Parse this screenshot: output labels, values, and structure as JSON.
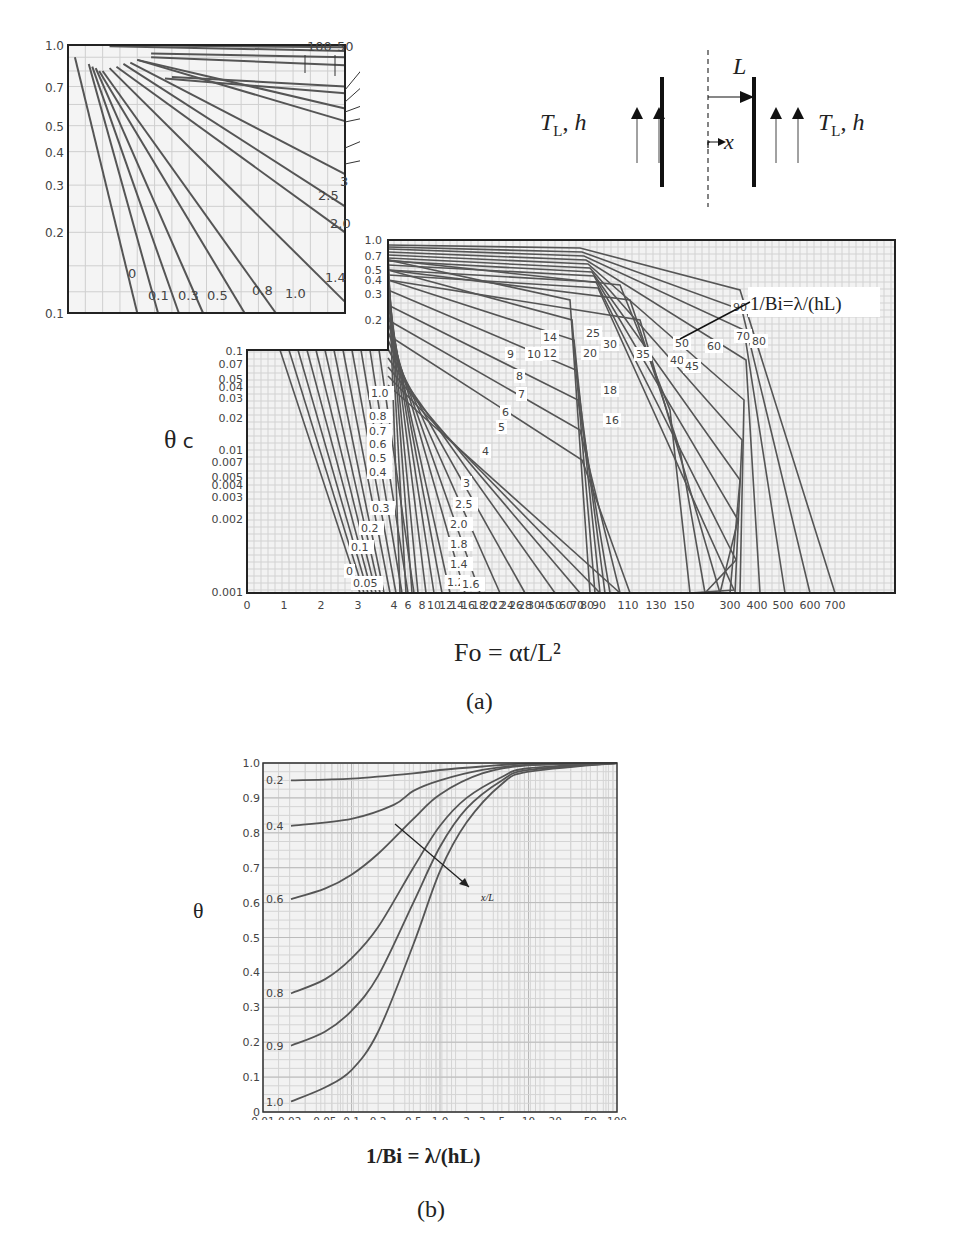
{
  "figure": {
    "caption_a": "(a)",
    "caption_b": "(b)"
  },
  "schematic": {
    "left_label_T": "T",
    "left_label_sub": "L",
    "left_label_rest": ", h",
    "right_label_T": "T",
    "right_label_sub": "L",
    "right_label_rest": ", h",
    "half_thickness_label": "L",
    "coordinate_label": "x"
  },
  "chart_data": [
    {
      "id": "a_inset",
      "type": "line",
      "title": "",
      "xlabel": "",
      "ylabel": "",
      "x_ticks": [
        "0",
        "1",
        "2",
        "3",
        "4"
      ],
      "y_ticks": [
        "1.0",
        "0.7",
        "0.5",
        "0.4",
        "0.3",
        "0.2",
        "0.1"
      ],
      "xlim": [
        0,
        4
      ],
      "ylim": [
        0.1,
        1.0
      ],
      "yscale": "log",
      "grid": true,
      "series_labels": [
        "0",
        "0.1",
        "0.3",
        "0.5",
        "0.8",
        "1.0",
        "1.4",
        "2.0",
        "2.5",
        "3",
        "6",
        "7",
        "9",
        "10",
        "20",
        "30",
        "50",
        "100"
      ],
      "series": [
        {
          "name": "0",
          "x": [
            0.1,
            1.0
          ],
          "y": [
            0.9,
            0.1
          ]
        },
        {
          "name": "0.1",
          "x": [
            0.3,
            1.3
          ],
          "y": [
            0.85,
            0.1
          ]
        },
        {
          "name": "0.3",
          "x": [
            0.35,
            1.6
          ],
          "y": [
            0.83,
            0.1
          ]
        },
        {
          "name": "0.5",
          "x": [
            0.4,
            1.95
          ],
          "y": [
            0.82,
            0.1
          ]
        },
        {
          "name": "0.8",
          "x": [
            0.45,
            2.55
          ],
          "y": [
            0.8,
            0.1
          ]
        },
        {
          "name": "1.0",
          "x": [
            0.5,
            3.0
          ],
          "y": [
            0.8,
            0.1
          ]
        },
        {
          "name": "1.4",
          "x": [
            0.6,
            4.0
          ],
          "y": [
            0.82,
            0.11
          ]
        },
        {
          "name": "2.0",
          "x": [
            0.7,
            4.0
          ],
          "y": [
            0.83,
            0.2
          ]
        },
        {
          "name": "2.5",
          "x": [
            0.8,
            4.0
          ],
          "y": [
            0.85,
            0.25
          ]
        },
        {
          "name": "3",
          "x": [
            0.9,
            4.0
          ],
          "y": [
            0.86,
            0.33
          ]
        },
        {
          "name": "6",
          "x": [
            1.0,
            4.0
          ],
          "y": [
            0.88,
            0.52
          ]
        },
        {
          "name": "7",
          "x": [
            1.0,
            4.0
          ],
          "y": [
            0.88,
            0.58
          ]
        },
        {
          "name": "9",
          "x": [
            1.4,
            4.0
          ],
          "y": [
            0.75,
            0.66
          ]
        },
        {
          "name": "10",
          "x": [
            1.5,
            4.0
          ],
          "y": [
            0.76,
            0.7
          ]
        },
        {
          "name": "20",
          "x": [
            1.2,
            4.0
          ],
          "y": [
            0.9,
            0.84
          ]
        },
        {
          "name": "30",
          "x": [
            1.2,
            4.0
          ],
          "y": [
            0.93,
            0.9
          ]
        },
        {
          "name": "50",
          "x": [
            0.6,
            4.0
          ],
          "y": [
            0.99,
            0.95
          ]
        },
        {
          "name": "100",
          "x": [
            0.6,
            4.0
          ],
          "y": [
            1.0,
            0.98
          ]
        }
      ]
    },
    {
      "id": "a_main",
      "type": "line",
      "title": "",
      "xlabel": "Fo = αt/L²",
      "ylabel": "θc",
      "legend_annotation": "1/Bi=λ/(hL)",
      "x_ticks": [
        "0",
        "1",
        "2",
        "3",
        "4",
        "6",
        "8",
        "10",
        "12",
        "14",
        "16",
        "18",
        "20",
        "22",
        "24",
        "26",
        "28",
        "30",
        "40",
        "50",
        "60",
        "70",
        "80",
        "90",
        "110",
        "130",
        "150",
        "300",
        "400",
        "500",
        "600",
        "700"
      ],
      "y_ticks_upper": [
        "1.0",
        "0.7",
        "0.5",
        "0.4",
        "0.3",
        "0.2"
      ],
      "y_ticks_lower": [
        "0.1",
        "0.07",
        "0.05",
        "0.04",
        "0.03",
        "0.02",
        "0.01",
        "0.007",
        "0.005",
        "0.004",
        "0.003",
        "0.002",
        "0.001"
      ],
      "xlim": [
        0,
        700
      ],
      "ylim": [
        0.001,
        1.0
      ],
      "yscale": "log",
      "xscale": "piecewise",
      "grid": true,
      "curve_labels_low": [
        "0",
        "0.05",
        "0.1",
        "0.2",
        "0.3",
        "0.4",
        "0.5",
        "0.6",
        "0.7",
        "0.8",
        "1.0"
      ],
      "curve_labels_mid": [
        "1.2",
        "1.4",
        "1.6",
        "1.8",
        "2.0",
        "2.5",
        "3",
        "4",
        "5",
        "6",
        "7",
        "8",
        "9",
        "10",
        "12",
        "14"
      ],
      "curve_labels_high": [
        "16",
        "18",
        "20",
        "25",
        "30",
        "35",
        "40",
        "45",
        "50",
        "60",
        "70",
        "80",
        "90",
        "100"
      ]
    },
    {
      "id": "b",
      "type": "line",
      "title": "",
      "xlabel": "1/Bi = λ/(hL)",
      "ylabel": "θ",
      "annotation": "x/L",
      "x_ticks": [
        "0.01",
        "0.02",
        "0.05",
        "0.1",
        "0.2",
        "0.5",
        "1.0",
        "2",
        "3",
        "5",
        "10",
        "20",
        "50",
        "100"
      ],
      "y_ticks": [
        "0",
        "0.1",
        "0.2",
        "0.3",
        "0.4",
        "0.5",
        "0.6",
        "0.7",
        "0.8",
        "0.9",
        "1.0"
      ],
      "xlim": [
        0.01,
        100
      ],
      "ylim": [
        0,
        1.0
      ],
      "xscale": "log",
      "grid": true,
      "series": [
        {
          "name": "0.2",
          "x": [
            0.01,
            0.1,
            0.5,
            1,
            3,
            10,
            100
          ],
          "y": [
            0.95,
            0.955,
            0.97,
            0.98,
            0.99,
            0.998,
            1.0
          ]
        },
        {
          "name": "0.4",
          "x": [
            0.01,
            0.1,
            0.3,
            0.5,
            1,
            3,
            10,
            100
          ],
          "y": [
            0.82,
            0.84,
            0.88,
            0.92,
            0.95,
            0.98,
            0.995,
            1.0
          ]
        },
        {
          "name": "0.6",
          "x": [
            0.01,
            0.05,
            0.1,
            0.2,
            0.5,
            1,
            3,
            10,
            100
          ],
          "y": [
            0.61,
            0.64,
            0.68,
            0.74,
            0.84,
            0.91,
            0.97,
            0.993,
            1.0
          ]
        },
        {
          "name": "0.8",
          "x": [
            0.01,
            0.05,
            0.1,
            0.2,
            0.5,
            1,
            2,
            5,
            10,
            100
          ],
          "y": [
            0.34,
            0.38,
            0.44,
            0.53,
            0.7,
            0.82,
            0.9,
            0.96,
            0.985,
            1.0
          ]
        },
        {
          "name": "0.9",
          "x": [
            0.01,
            0.05,
            0.1,
            0.2,
            0.5,
            1,
            2,
            5,
            10,
            100
          ],
          "y": [
            0.19,
            0.23,
            0.29,
            0.39,
            0.6,
            0.76,
            0.87,
            0.95,
            0.98,
            1.0
          ]
        },
        {
          "name": "1.0",
          "x": [
            0.01,
            0.05,
            0.1,
            0.2,
            0.5,
            1,
            2,
            5,
            10,
            100
          ],
          "y": [
            0.03,
            0.07,
            0.12,
            0.23,
            0.48,
            0.69,
            0.83,
            0.94,
            0.975,
            1.0
          ]
        }
      ]
    }
  ]
}
